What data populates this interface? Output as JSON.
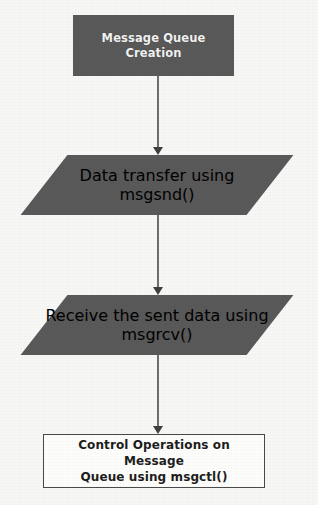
{
  "diagram": {
    "background_color": "#f7f7f5",
    "fill_color": "#595959",
    "fill_text_color": "#f2f2f2",
    "outline_color": "#4a4a4a",
    "outline_text_color": "#1d1d1d",
    "connector_color": "#6e6e6e",
    "arrowhead_color": "#3f3f3f",
    "nodes": [
      {
        "id": "message-queue-creation",
        "shape": "rectangle",
        "style": "filled",
        "label": "Message Queue\nCreation"
      },
      {
        "id": "data-transfer-msgsnd",
        "shape": "parallelogram",
        "style": "filled",
        "label": "Data transfer using\nmsgsnd()"
      },
      {
        "id": "receive-data-msgrcv",
        "shape": "parallelogram",
        "style": "filled",
        "label": "Receive the sent data\nusing msgrcv()"
      },
      {
        "id": "control-operations-msgctl",
        "shape": "rectangle",
        "style": "outlined",
        "label": "Control Operations on Message\nQueue using msgctl()"
      }
    ],
    "connectors": [
      {
        "id": "arrow-creation-to-transfer",
        "from": "message-queue-creation",
        "to": "data-transfer-msgsnd",
        "direction": "down"
      },
      {
        "id": "arrow-transfer-to-receive",
        "from": "data-transfer-msgsnd",
        "to": "receive-data-msgrcv",
        "direction": "down"
      },
      {
        "id": "arrow-receive-to-control",
        "from": "receive-data-msgrcv",
        "to": "control-operations-msgctl",
        "direction": "down"
      }
    ]
  }
}
